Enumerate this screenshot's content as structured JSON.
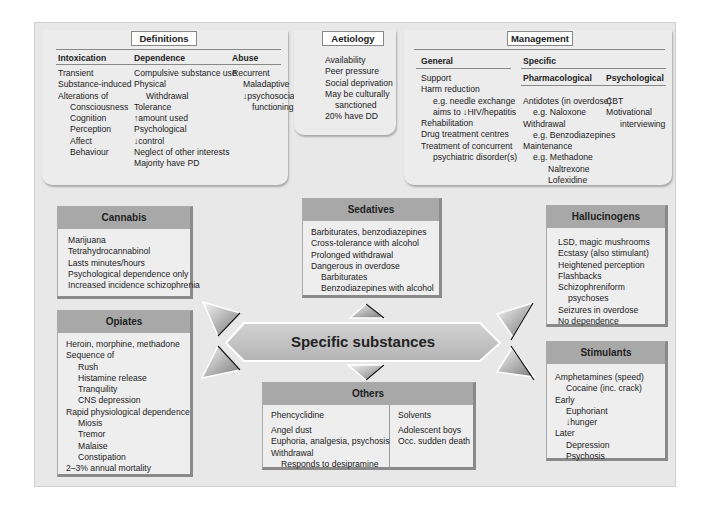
{
  "definitions": {
    "title": "Definitions",
    "columns": [
      {
        "heading": "Intoxication",
        "items": [
          {
            "text": "Transient",
            "indent": 0
          },
          {
            "text": "Substance-induced",
            "indent": 0
          },
          {
            "text": "Alterations of",
            "indent": 0
          },
          {
            "text": "Consciousness",
            "indent": 1
          },
          {
            "text": "Cognition",
            "indent": 1
          },
          {
            "text": "Perception",
            "indent": 1
          },
          {
            "text": "Affect",
            "indent": 1
          },
          {
            "text": "Behaviour",
            "indent": 1
          }
        ]
      },
      {
        "heading": "Dependence",
        "items": [
          {
            "text": "Compulsive substance use",
            "indent": 0
          },
          {
            "text": "Physical",
            "indent": 0
          },
          {
            "text": "Withdrawal",
            "indent": 1
          },
          {
            "text": "Tolerance",
            "indent": 0
          },
          {
            "text": "↑amount used",
            "indent": 0
          },
          {
            "text": "Psychological",
            "indent": 0
          },
          {
            "text": "↓control",
            "indent": 0
          },
          {
            "text": "Neglect of other interests",
            "indent": 0
          },
          {
            "text": "Majority have PD",
            "indent": 0
          }
        ]
      },
      {
        "heading": "Abuse",
        "items": [
          {
            "text": "Recurrent",
            "indent": 0
          },
          {
            "text": "Maladaptive",
            "indent": 1
          },
          {
            "text": "↓psychosocial",
            "indent": 1
          },
          {
            "text": "functioning",
            "indent": 2
          }
        ]
      }
    ]
  },
  "aetiology": {
    "title": "Aetiology",
    "items": [
      {
        "text": "Availability",
        "indent": 0
      },
      {
        "text": "Peer pressure",
        "indent": 0
      },
      {
        "text": "Social deprivation",
        "indent": 0
      },
      {
        "text": "May be culturally",
        "indent": 0
      },
      {
        "text": "sanctioned",
        "indent": 1
      },
      {
        "text": "20% have DD",
        "indent": 0
      }
    ]
  },
  "management": {
    "title": "Management",
    "general": {
      "heading": "General",
      "items": [
        {
          "text": "Support",
          "indent": 0
        },
        {
          "text": "Harm reduction",
          "indent": 0
        },
        {
          "text": "e.g. needle exchange",
          "indent": 1
        },
        {
          "text": "aims to ↓HIV/hepatitis",
          "indent": 1
        },
        {
          "text": "Rehabilitation",
          "indent": 0
        },
        {
          "text": "Drug treatment centres",
          "indent": 0
        },
        {
          "text": "Treatment of concurrent",
          "indent": 0
        },
        {
          "text": "psychiatric disorder(s)",
          "indent": 1
        }
      ]
    },
    "specific": {
      "heading": "Specific",
      "pharmacological": {
        "heading": "Pharmacological",
        "items": [
          {
            "text": "Antidotes (in overdose)",
            "indent": 0
          },
          {
            "text": "e.g. Naloxone",
            "indent": 1
          },
          {
            "text": "Withdrawal",
            "indent": 0
          },
          {
            "text": "e.g. Benzodiazepines",
            "indent": 1
          },
          {
            "text": "Maintenance",
            "indent": 0
          },
          {
            "text": "e.g. Methadone",
            "indent": 1
          },
          {
            "text": "Naltrexone",
            "indent": 2
          },
          {
            "text": "Lofexidine",
            "indent": 2
          }
        ]
      },
      "psychological": {
        "heading": "Psychological",
        "items": [
          {
            "text": "CBT",
            "indent": 0
          },
          {
            "text": "Motivational",
            "indent": 0
          },
          {
            "text": "interviewing",
            "indent": 1
          }
        ]
      }
    }
  },
  "center": {
    "label": "Specific substances"
  },
  "substances": {
    "cannabis": {
      "title": "Cannabis",
      "items": [
        {
          "text": "Marijuana",
          "indent": 0
        },
        {
          "text": "Tetrahydrocannabinol",
          "indent": 0
        },
        {
          "text": "Lasts minutes/hours",
          "indent": 0
        },
        {
          "text": "Psychological dependence only",
          "indent": 0
        },
        {
          "text": "Increased incidence schizophrenia",
          "indent": 0
        }
      ]
    },
    "opiates": {
      "title": "Opiates",
      "items": [
        {
          "text": "Heroin, morphine, methadone",
          "indent": 0
        },
        {
          "text": "Sequence of",
          "indent": 0
        },
        {
          "text": "Rush",
          "indent": 1
        },
        {
          "text": "Histamine release",
          "indent": 1
        },
        {
          "text": "Tranquility",
          "indent": 1
        },
        {
          "text": "CNS depression",
          "indent": 1
        },
        {
          "text": "Rapid physiological dependence",
          "indent": 0
        },
        {
          "text": "Miosis",
          "indent": 1
        },
        {
          "text": "Tremor",
          "indent": 1
        },
        {
          "text": "Malaise",
          "indent": 1
        },
        {
          "text": "Constipation",
          "indent": 1
        },
        {
          "text": "2–3% annual mortality",
          "indent": 0
        }
      ]
    },
    "sedatives": {
      "title": "Sedatives",
      "items": [
        {
          "text": "Barbiturates, benzodiazepines",
          "indent": 0
        },
        {
          "text": "Cross-tolerance with alcohol",
          "indent": 0
        },
        {
          "text": "Prolonged withdrawal",
          "indent": 0
        },
        {
          "text": "Dangerous in overdose",
          "indent": 0
        },
        {
          "text": "Barbiturates",
          "indent": 1
        },
        {
          "text": "Benzodiazepines with alcohol",
          "indent": 1
        }
      ]
    },
    "hallucinogens": {
      "title": "Hallucinogens",
      "items": [
        {
          "text": "LSD, magic mushrooms",
          "indent": 0
        },
        {
          "text": "Ecstasy (also stimulant)",
          "indent": 0
        },
        {
          "text": "Heightened perception",
          "indent": 0
        },
        {
          "text": "Flashbacks",
          "indent": 0
        },
        {
          "text": "Schizophreniform",
          "indent": 0
        },
        {
          "text": "psychoses",
          "indent": 1
        },
        {
          "text": "Seizures in overdose",
          "indent": 0
        },
        {
          "text": "No dependence",
          "indent": 0
        }
      ]
    },
    "stimulants": {
      "title": "Stimulants",
      "items": [
        {
          "text": "Amphetamines (speed)",
          "indent": 0
        },
        {
          "text": "Cocaine (inc. crack)",
          "indent": 1
        },
        {
          "text": "Early",
          "indent": 0
        },
        {
          "text": "Euphoriant",
          "indent": 1
        },
        {
          "text": "↓hunger",
          "indent": 1
        },
        {
          "text": "Later",
          "indent": 0
        },
        {
          "text": "Depression",
          "indent": 1
        },
        {
          "text": "Psychosis",
          "indent": 1
        }
      ]
    },
    "others": {
      "title": "Others",
      "phencyclidine": {
        "heading": "Phencyclidine",
        "items": [
          {
            "text": "Angel dust",
            "indent": 0
          },
          {
            "text": "Euphoria, analgesia, psychosis",
            "indent": 0
          },
          {
            "text": "Withdrawal",
            "indent": 0
          },
          {
            "text": "Responds to desipramine",
            "indent": 1
          }
        ]
      },
      "solvents": {
        "heading": "Solvents",
        "items": [
          {
            "text": "Adolescent boys",
            "indent": 0
          },
          {
            "text": "Occ. sudden death",
            "indent": 0
          }
        ]
      }
    }
  },
  "colors": {
    "background": "#e8e8e8",
    "box_header": "#a8a8a8",
    "center_band": "#c4c4c4"
  }
}
